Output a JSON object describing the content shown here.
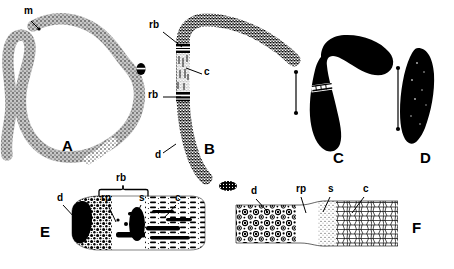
{
  "figure": {
    "type": "scientific-line-drawing",
    "background_color": "#ffffff",
    "ink_color": "#000000",
    "panels": [
      {
        "id": "A",
        "label": "A",
        "caption_x": 62,
        "caption_y": 145,
        "render": "long sinuous stippled filament, open C-shaped curve, light stipple fill"
      },
      {
        "id": "B",
        "label": "B",
        "caption_x": 204,
        "caption_y": 148,
        "render": "bent dark-stippled filament with two pale cross-bands (reproductive bands)"
      },
      {
        "id": "C",
        "label": "C",
        "caption_x": 333,
        "caption_y": 158,
        "render": "solid black boomerang/club-shaped body with a single pale constriction band"
      },
      {
        "id": "D",
        "label": "D",
        "caption_x": 420,
        "caption_y": 158,
        "render": "solid black elongate spindle-shaped body"
      },
      {
        "id": "E",
        "label": "E",
        "caption_x": 40,
        "caption_y": 232,
        "render": "enlarged longitudinal section: dense dark granular region left, pale middle, solid black septum, reticulate region right"
      },
      {
        "id": "F",
        "label": "F",
        "caption_x": 412,
        "caption_y": 228,
        "render": "enlarged longitudinal section: large circular vacuoles left, pale band, fine stipple, polygonal cell network right"
      }
    ],
    "annotations": [
      {
        "text": "m",
        "x": 24,
        "y": 12,
        "name": "label-m-panel-a",
        "leader": {
          "x1": 31,
          "y1": 21,
          "x2": 39,
          "y2": 29
        }
      },
      {
        "text": "rb",
        "x": 149,
        "y": 26,
        "name": "label-rb-upper-panel-b",
        "leader": {
          "x1": 163,
          "y1": 32,
          "x2": 182,
          "y2": 47
        }
      },
      {
        "text": "c",
        "x": 204,
        "y": 72,
        "name": "label-c-panel-b",
        "leader": {
          "x1": 202,
          "y1": 74,
          "x2": 186,
          "y2": 68
        }
      },
      {
        "text": "rb",
        "x": 148,
        "y": 93,
        "name": "label-rb-lower-panel-b",
        "leader": {
          "x1": 163,
          "y1": 97,
          "x2": 181,
          "y2": 97
        }
      },
      {
        "text": "d",
        "x": 155,
        "y": 155,
        "name": "label-d-panel-b",
        "leader": {
          "x1": 163,
          "y1": 153,
          "x2": 176,
          "y2": 144
        }
      },
      {
        "text": "rb",
        "x": 116,
        "y": 178,
        "name": "label-rb-panel-e-bracket"
      },
      {
        "text": "rp",
        "x": 101,
        "y": 198,
        "name": "label-rp-panel-e",
        "leader": {
          "x1": 108,
          "y1": 205,
          "x2": 116,
          "y2": 222
        }
      },
      {
        "text": "s",
        "x": 139,
        "y": 198,
        "name": "label-s-panel-e",
        "leader": {
          "x1": 141,
          "y1": 205,
          "x2": 133,
          "y2": 222
        }
      },
      {
        "text": "d",
        "x": 57,
        "y": 198,
        "name": "label-d-panel-e",
        "leader": {
          "x1": 63,
          "y1": 205,
          "x2": 76,
          "y2": 219
        }
      },
      {
        "text": "c",
        "x": 175,
        "y": 198,
        "name": "label-c-panel-e",
        "leader": {
          "x1": 176,
          "y1": 205,
          "x2": 164,
          "y2": 218
        }
      },
      {
        "text": "d",
        "x": 251,
        "y": 192,
        "name": "label-d-panel-f",
        "leader": {
          "x1": 256,
          "y1": 199,
          "x2": 267,
          "y2": 211
        }
      },
      {
        "text": "rp",
        "x": 296,
        "y": 190,
        "name": "label-rp-panel-f",
        "leader": {
          "x1": 301,
          "y1": 197,
          "x2": 306,
          "y2": 213
        }
      },
      {
        "text": "s",
        "x": 328,
        "y": 190,
        "name": "label-s-panel-f",
        "leader": {
          "x1": 330,
          "y1": 197,
          "x2": 323,
          "y2": 212
        }
      },
      {
        "text": "c",
        "x": 363,
        "y": 190,
        "name": "label-c-panel-f",
        "leader": {
          "x1": 364,
          "y1": 197,
          "x2": 352,
          "y2": 213
        }
      }
    ],
    "scale_arrows": [
      {
        "name": "scale-arrow-c",
        "x": 296,
        "y1": 72,
        "y2": 113
      },
      {
        "name": "scale-arrow-d",
        "x": 398,
        "y1": 68,
        "y2": 129
      }
    ],
    "bracket": {
      "name": "rb-bracket-panel-e",
      "x1": 99,
      "x2": 148,
      "y": 190,
      "tick": 6
    },
    "ellipse_marker": {
      "name": "ellipse-marker-panel-b",
      "cx": 141,
      "cy": 69,
      "rx": 5,
      "ry": 6
    }
  }
}
